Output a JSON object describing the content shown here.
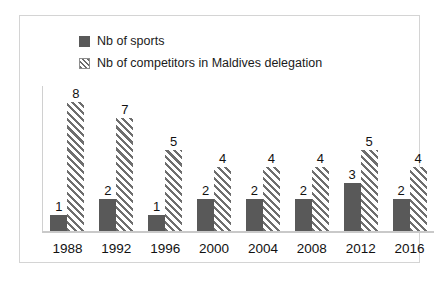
{
  "chart_data": {
    "type": "bar",
    "title": "",
    "xlabel": "",
    "ylabel": "",
    "ylim": [
      0,
      9
    ],
    "grid": false,
    "legend_position": "top-left",
    "categories": [
      "1988",
      "1992",
      "1996",
      "2000",
      "2004",
      "2008",
      "2012",
      "2016"
    ],
    "series": [
      {
        "name": "Nb of sports",
        "style": "solid",
        "color": "#595959",
        "values": [
          1,
          2,
          1,
          2,
          2,
          2,
          3,
          2
        ]
      },
      {
        "name": "Nb of competitors in Maldives delegation",
        "style": "diagonal-hatch",
        "color": "#6e6e6e",
        "values": [
          8,
          7,
          5,
          4,
          4,
          4,
          5,
          4
        ]
      }
    ]
  },
  "legend": {
    "items": [
      {
        "label": "Nb of sports",
        "swatch": "solid-square-icon"
      },
      {
        "label": "Nb of competitors in Maldives delegation",
        "swatch": "hatched-square-icon"
      }
    ]
  },
  "colors": {
    "series_solid": "#595959",
    "series_hatch": "#6e6e6e",
    "frame_border": "#d4d4d4",
    "axis_line": "#c9c9c9",
    "background": "#ffffff",
    "label_text": "#111111"
  }
}
